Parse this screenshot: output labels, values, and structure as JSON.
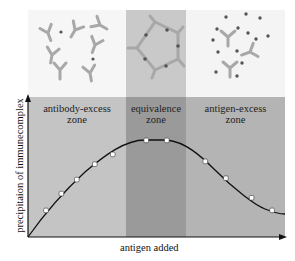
{
  "diagram": {
    "colors": {
      "background": "#ffffff",
      "top_left_panel": "#f6f6f6",
      "top_middle_panel": "#c9c9c9",
      "top_right_panel": "#f4f4f4",
      "zone_left": "#c4c4c4",
      "zone_middle": "#9a9a9a",
      "zone_right": "#b4b4b4",
      "antibody": "#a8a8a8",
      "antigen": "#555555",
      "curve": "#111111",
      "marker_fill": "#ffffff"
    },
    "zones": [
      {
        "id": "antibody-excess",
        "line1": "antibody-excess",
        "line2": "zone"
      },
      {
        "id": "equivalence",
        "line1": "equivalence",
        "line2": "zone"
      },
      {
        "id": "antigen-excess",
        "line1": "antigen-excess",
        "line2": "zone"
      }
    ],
    "panels": [
      {
        "id": "antibody-excess-illustration",
        "description": "scattered antibodies with few antigens, small complexes"
      },
      {
        "id": "equivalence-illustration",
        "description": "antibodies and antigens forming a closed lattice ring"
      },
      {
        "id": "antigen-excess-illustration",
        "description": "many free antigens, antibodies saturated"
      }
    ],
    "axes": {
      "ylabel": "precipitaion of immunecomplex",
      "xlabel": "antigen added"
    }
  },
  "chart_data": {
    "type": "line",
    "title": "",
    "xlabel": "antigen added",
    "ylabel": "precipitaion of immunecomplex",
    "xlim": [
      0,
      100
    ],
    "ylim": [
      0,
      100
    ],
    "grid": false,
    "legend": null,
    "series": [
      {
        "name": "precipitation curve (markers)",
        "x": [
          7,
          13,
          19,
          26,
          33,
          46,
          54,
          69,
          77,
          87,
          95
        ],
        "values": [
          19,
          31,
          41,
          52,
          59,
          69,
          69,
          54,
          42,
          28,
          19
        ]
      }
    ],
    "annotations": [
      "antibody-excess zone",
      "equivalence zone",
      "antigen-excess zone"
    ]
  }
}
